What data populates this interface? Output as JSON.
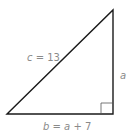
{
  "diagram": {
    "type": "right-triangle",
    "labels": {
      "hypotenuse": "c = 13",
      "vertical_leg": "a",
      "horizontal_leg": "b = a + 7"
    },
    "colors": {
      "stroke": "#1a1a1a",
      "label": "#8a8a8a",
      "right_angle_marker": "#555555"
    }
  }
}
